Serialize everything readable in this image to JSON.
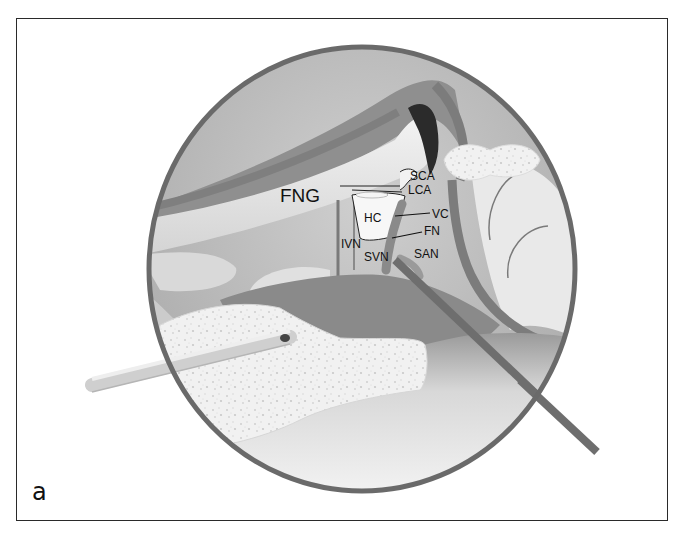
{
  "figure": {
    "panel_letter": "a",
    "caption": ""
  },
  "labels": {
    "fng": "FNG",
    "sca": "SCA",
    "lca": "LCA",
    "hc": "HC",
    "vc": "VC",
    "fn": "FN",
    "ivn": "IVN",
    "svn": "SVN",
    "san": "SAN"
  },
  "colors": {
    "rim": "#6a6a6a",
    "background_tissue": "#b9b9b9",
    "cavity": "#8a8a8a",
    "bone_light": "#e6e6e6",
    "dark_spot": "#2b2b2b",
    "frame": "#2a2a2a"
  }
}
